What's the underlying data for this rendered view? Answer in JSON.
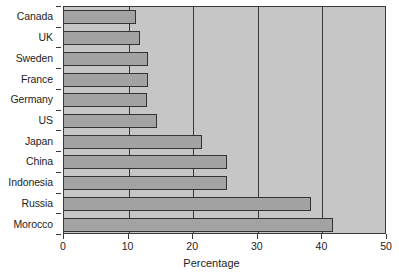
{
  "chart_data": {
    "type": "bar",
    "orientation": "horizontal",
    "title": "",
    "subtitle": "",
    "xlabel": "Percentage",
    "ylabel": "",
    "xlim": [
      0,
      50
    ],
    "xticks": [
      0,
      10,
      20,
      30,
      40,
      50
    ],
    "xtick_labels": [
      "0",
      "10",
      "20",
      "30",
      "40",
      "50"
    ],
    "grid": true,
    "grid_axis": "x",
    "legend": false,
    "legend_position": "none",
    "categories": [
      "Canada",
      "UK",
      "Sweden",
      "France",
      "Germany",
      "US",
      "Japan",
      "China",
      "Indonesia",
      "Russia",
      "Morocco"
    ],
    "values": [
      11.2,
      11.8,
      13.0,
      13.0,
      12.9,
      14.4,
      21.4,
      25.3,
      25.3,
      38.2,
      41.6
    ],
    "series": [
      {
        "name": "Percentage",
        "values": [
          11.2,
          11.8,
          13.0,
          13.0,
          12.9,
          14.4,
          21.4,
          25.3,
          25.3,
          38.2,
          41.6
        ]
      }
    ],
    "colors": {
      "bar_fill": "#a3a3a3",
      "bar_edge": "#333333",
      "plot_background": "#c6c6c6",
      "grid_color": "#3a3a3a",
      "axis_color": "#3a3a3a",
      "text_color": "#1d1d1d",
      "figure_background": "#ffffff"
    }
  }
}
